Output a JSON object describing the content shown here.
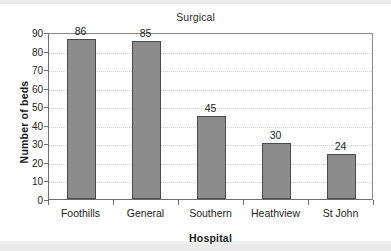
{
  "chart_data": {
    "type": "bar",
    "title": "Surgical",
    "xlabel": "Hospital",
    "ylabel": "Number of beds",
    "categories": [
      "Foothills",
      "General",
      "Southern",
      "Heathview",
      "St John"
    ],
    "values": [
      86,
      85,
      45,
      30,
      24
    ],
    "value_labels": [
      "86",
      "85",
      "45",
      "30",
      "24"
    ],
    "ylim": [
      0,
      90
    ],
    "ytick_labels": [
      "0",
      "10",
      "20",
      "30",
      "40",
      "50",
      "60",
      "70",
      "80",
      "90"
    ],
    "ytick_values": [
      0,
      10,
      20,
      30,
      40,
      50,
      60,
      70,
      80,
      90
    ],
    "grid": true,
    "legend": "none",
    "colors": {
      "bar_fill": "#8c8c8c",
      "bar_stroke": "#4a4a4a",
      "axis": "#6e6e6e",
      "gridline": "#cfcfcf",
      "text": "#232323",
      "background": "#ffffff"
    }
  }
}
